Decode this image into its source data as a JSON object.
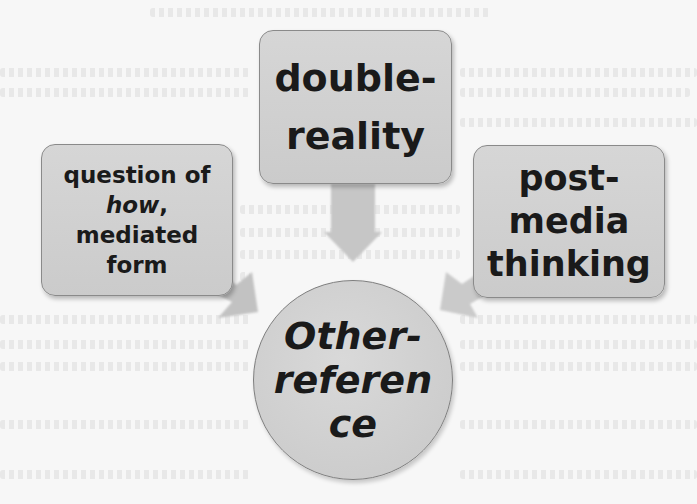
{
  "diagram": {
    "type": "convergence",
    "colors": {
      "box_fill": "#d0d0d0",
      "box_border": "#8a8a8a",
      "arrow_fill": "#c4c4c4",
      "text": "#1a1a1a",
      "background": "#f7f7f7"
    },
    "nodes": {
      "top": {
        "lines": [
          "double-",
          "reality"
        ]
      },
      "left": {
        "lines": [
          "question of",
          "how",
          ",",
          "mediated",
          "form"
        ]
      },
      "right": {
        "lines": [
          "post-",
          "media",
          "thinking"
        ]
      },
      "center": {
        "lines": [
          "Other-",
          "referen",
          "ce"
        ]
      }
    },
    "edges": [
      {
        "from": "top",
        "to": "center"
      },
      {
        "from": "left",
        "to": "center"
      },
      {
        "from": "right",
        "to": "center"
      }
    ]
  }
}
